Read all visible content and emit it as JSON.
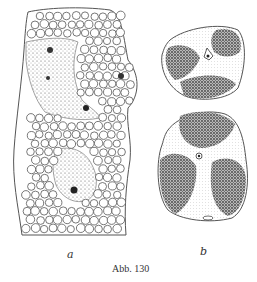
{
  "figure": {
    "caption": "Abb. 130",
    "panels": [
      {
        "label": "a",
        "description": "tissue section with large round cells and stippled cytoplasmic strands with nuclei"
      },
      {
        "label": "b",
        "description": "two isolated cells with dense granular regions separated by lighter stippled zones"
      }
    ]
  },
  "colors": {
    "ink": "#444444",
    "background": "#ffffff"
  }
}
